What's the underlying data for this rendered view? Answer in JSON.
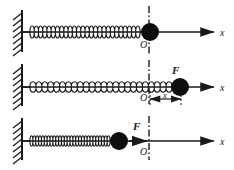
{
  "figure": {
    "stroke_color": "#1a1a1a",
    "mass_color": "#0d0d0d",
    "background": "#ffffff"
  },
  "axis_origin_x": 149,
  "panels": [
    {
      "id": "panel-equilibrium",
      "state": "equilibrium",
      "baseline_y": 32,
      "wall": {
        "x": 22,
        "top": 10,
        "bottom": 52,
        "hatch_count": 7
      },
      "spring": {
        "x_start": 30,
        "x_end": 140,
        "coils": 26,
        "amplitude": 8,
        "density": "natural"
      },
      "mass": {
        "cx": 150,
        "cy": 32,
        "r": 9
      },
      "axis": {
        "x_start": 22,
        "x_end": 214,
        "y": 32
      },
      "origin_line": {
        "x": 149,
        "top": 6,
        "bottom": 56
      },
      "origin_label": "O",
      "origin_label_x": 140,
      "origin_label_y": 48,
      "axis_label": "x",
      "axis_label_x": 220,
      "axis_label_y": 36,
      "force_label": null,
      "dimension": null
    },
    {
      "id": "panel-stretched",
      "state": "stretched",
      "baseline_y": 87,
      "wall": {
        "x": 22,
        "top": 64,
        "bottom": 106,
        "hatch_count": 7
      },
      "spring": {
        "x_start": 30,
        "x_end": 172,
        "coils": 24,
        "amplitude": 7,
        "density": "extended"
      },
      "mass": {
        "cx": 180,
        "cy": 87,
        "r": 9
      },
      "axis": {
        "x_start": 22,
        "x_end": 214,
        "y": 87
      },
      "origin_line": {
        "x": 149,
        "top": 60,
        "bottom": 104
      },
      "origin_label": "O",
      "origin_label_x": 140,
      "origin_label_y": 101,
      "axis_label": "x",
      "axis_label_x": 220,
      "axis_label_y": 91,
      "force_label": "F",
      "force_label_x": 172,
      "force_label_y": 74,
      "dimension": {
        "label": "x",
        "x_from": 150,
        "x_to": 181,
        "y": 99,
        "label_x": 165,
        "label_y": 98,
        "tick_top": 91,
        "tick_bottom": 106
      }
    },
    {
      "id": "panel-compressed",
      "state": "compressed",
      "baseline_y": 141,
      "wall": {
        "x": 22,
        "top": 118,
        "bottom": 160,
        "hatch_count": 7
      },
      "spring": {
        "x_start": 30,
        "x_end": 110,
        "coils": 28,
        "amplitude": 7,
        "density": "compressed"
      },
      "mass": {
        "cx": 119,
        "cy": 141,
        "r": 9
      },
      "axis": {
        "x_start": 22,
        "x_end": 214,
        "y": 141
      },
      "origin_line": {
        "x": 149,
        "top": 116,
        "bottom": 160
      },
      "origin_label": "O",
      "origin_label_x": 140,
      "origin_label_y": 155,
      "axis_label": "x",
      "axis_label_x": 220,
      "axis_label_y": 145,
      "force_label": "F",
      "force_label_x": 133,
      "force_label_y": 130,
      "force_arrow": {
        "x_from": 129,
        "x_to": 147,
        "y": 141
      },
      "dimension": null
    }
  ]
}
